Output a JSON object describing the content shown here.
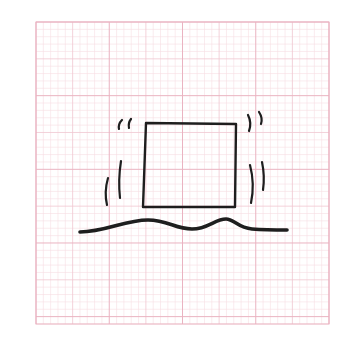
{
  "figure": {
    "description": "Hand-drawn square box shaking/vibrating above a wavy ground line on pink graph paper",
    "colors": {
      "background": "#ffffff",
      "grid_fine": "#f6dde3",
      "grid_mid": "#f0c6d0",
      "grid_major": "#eab3c1",
      "ink": "#1e1e1e"
    },
    "grid": {
      "x": 36,
      "y": 22,
      "width": 293,
      "height": 302,
      "fine_step": 7.33,
      "major_step": 36.6
    },
    "square": {
      "points": [
        [
          146,
          123
        ],
        [
          236,
          124
        ],
        [
          235,
          207
        ],
        [
          143,
          207
        ]
      ],
      "label": "box"
    },
    "ground": {
      "label": "wavy-ground-line",
      "path": "M80 232 C 105 232, 125 220, 148 220 C 168 220, 175 229, 192 229 C 208 229, 215 219, 226 219 C 234 219, 238 228, 252 229 C 265 230, 278 230, 287 230"
    },
    "motion_marks": [
      {
        "name": "left-top-tick-1",
        "path": "M122 120 Q 118 124, 119 129"
      },
      {
        "name": "left-top-tick-2",
        "path": "M131 119 Q 128 123, 129 128"
      },
      {
        "name": "left-long-arc-inner",
        "path": "M121 161 Q 118 180, 120 198"
      },
      {
        "name": "left-long-arc-outer",
        "path": "M108 178 Q 104 192, 107 205"
      },
      {
        "name": "right-top-arc-1",
        "path": "M248 115 Q 252 123, 249 131"
      },
      {
        "name": "right-top-arc-2",
        "path": "M259 112 Q 263 118, 261 124"
      },
      {
        "name": "right-long-arc-inner",
        "path": "M250 165 Q 255 184, 251 203"
      },
      {
        "name": "right-long-arc-outer",
        "path": "M262 162 Q 265 176, 263 190"
      }
    ]
  }
}
